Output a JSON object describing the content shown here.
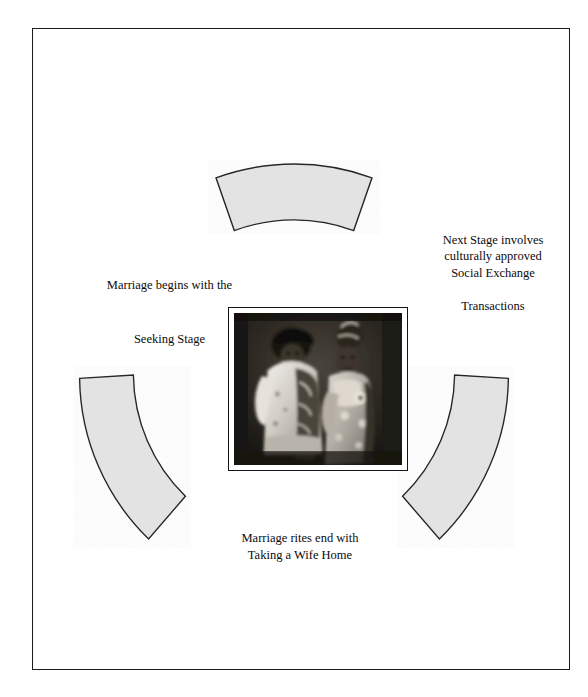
{
  "page": {
    "background_color": "#ffffff",
    "frame_color": "#1b1b1b"
  },
  "diagram": {
    "type": "cycle-diagram",
    "title_visible": false,
    "arc_fill_color": "#e3e3e3",
    "arc_stroke_color": "#262626",
    "segments": [
      {
        "name": "top-arc",
        "label": ""
      },
      {
        "name": "left-arc",
        "label": ""
      },
      {
        "name": "right-arc",
        "label": ""
      }
    ],
    "captions": {
      "seeking": {
        "line_a": "Marriage begins with the",
        "line_b": "Seeking Stage"
      },
      "exchange": {
        "line_a": "Next Stage involves\nculturally approved\nSocial Exchange",
        "line_b": "Transactions"
      },
      "taking": {
        "text": "Marriage rites end with\nTaking a Wife Home"
      }
    },
    "center_photo": {
      "name": "traditional-wedding-couple-photograph",
      "description": "Black and white photograph of a couple in traditional ceremonial attire",
      "border_color": "#141414"
    }
  }
}
